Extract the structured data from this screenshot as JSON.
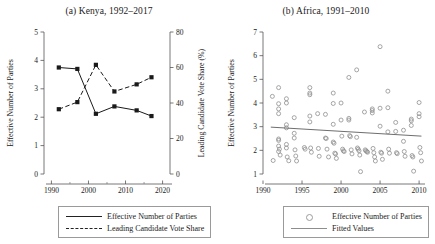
{
  "figure": {
    "panels": [
      {
        "id": "kenya",
        "title": "(a) Kenya, 1992–2017",
        "legend": [
          {
            "key": "solid-line",
            "label": "Effective Number of Parties"
          },
          {
            "key": "dashed-line",
            "label": "Leading Candidate Vote Share"
          }
        ]
      },
      {
        "id": "africa",
        "title": "(b) Africa, 1991–2010",
        "legend": [
          {
            "key": "open-circle",
            "label": "Effective Number of Parties"
          },
          {
            "key": "solid-line",
            "label": "Fitted Values"
          }
        ]
      }
    ]
  },
  "chart_data": [
    {
      "type": "line",
      "id": "kenya",
      "title": "(a) Kenya, 1992–2017",
      "xlabel": "",
      "ylabel": "Effective Number of Parties",
      "y2label": "Leading Candidate Vote Share (%)",
      "x": [
        1992,
        1997,
        2002,
        2007,
        2013,
        2017
      ],
      "xlim": [
        1988,
        2022
      ],
      "ylim": [
        0,
        5
      ],
      "y2lim": [
        0,
        80
      ],
      "xticks": [
        1990,
        2000,
        2010,
        2020
      ],
      "xticklabels": [
        "1990",
        "2000",
        "2010",
        "2020"
      ],
      "xminorticks": [
        1995,
        2005,
        2015
      ],
      "yticks": [
        0,
        1,
        2,
        3,
        4,
        5
      ],
      "yticklabels": [
        "0",
        "1",
        "2",
        "3",
        "4",
        "5"
      ],
      "y2ticks": [
        0,
        20,
        40,
        60,
        80
      ],
      "y2ticklabels": [
        "0",
        "20",
        "40",
        "60",
        "80"
      ],
      "grid": false,
      "legend_position": "below",
      "series": [
        {
          "name": "Effective Number of Parties",
          "style": "solid",
          "marker": "filled-square",
          "axis": "left",
          "values": [
            3.75,
            3.7,
            2.12,
            2.38,
            2.24,
            2.04
          ]
        },
        {
          "name": "Leading Candidate Vote Share",
          "style": "dashed",
          "marker": "filled-square",
          "axis": "right",
          "values": [
            36.5,
            40.5,
            61.5,
            46.5,
            50.5,
            54.5
          ]
        }
      ]
    },
    {
      "type": "scatter",
      "id": "africa",
      "title": "(b) Africa, 1991–2010",
      "xlabel": "",
      "ylabel": "Effective Number of Parties",
      "xlim": [
        1990,
        2010.5
      ],
      "ylim": [
        1,
        7
      ],
      "xticks": [
        1990,
        1995,
        2000,
        2005,
        2010
      ],
      "xticklabels": [
        "1990",
        "1995",
        "2000",
        "2005",
        "2010"
      ],
      "yticks": [
        1,
        2,
        3,
        4,
        5,
        6,
        7
      ],
      "yticklabels": [
        "1",
        "2",
        "3",
        "4",
        "5",
        "6",
        "7"
      ],
      "grid": false,
      "legend_position": "below",
      "marker": "open-circle",
      "points": [
        [
          1991.2,
          4.28
        ],
        [
          1991.3,
          1.57
        ],
        [
          1992.0,
          4.65
        ],
        [
          1992.0,
          3.97
        ],
        [
          1992.0,
          3.75
        ],
        [
          1992.0,
          3.55
        ],
        [
          1992.0,
          2.48
        ],
        [
          1992.0,
          2.42
        ],
        [
          1992.0,
          2.18
        ],
        [
          1992.0,
          1.95
        ],
        [
          1992.1,
          2.05
        ],
        [
          1992.2,
          1.8
        ],
        [
          1993.0,
          4.18
        ],
        [
          1993.0,
          4.0
        ],
        [
          1993.0,
          3.08
        ],
        [
          1993.0,
          2.95
        ],
        [
          1993.0,
          2.25
        ],
        [
          1993.0,
          2.1
        ],
        [
          1993.1,
          1.72
        ],
        [
          1993.3,
          1.56
        ],
        [
          1994.0,
          3.38
        ],
        [
          1994.0,
          2.72
        ],
        [
          1994.0,
          2.52
        ],
        [
          1994.1,
          2.02
        ],
        [
          1994.2,
          1.76
        ],
        [
          1994.3,
          1.55
        ],
        [
          1995.3,
          2.12
        ],
        [
          1995.4,
          2.05
        ],
        [
          1996.0,
          4.65
        ],
        [
          1996.0,
          4.42
        ],
        [
          1996.0,
          4.35
        ],
        [
          1996.0,
          3.45
        ],
        [
          1996.0,
          3.2
        ],
        [
          1996.1,
          2.1
        ],
        [
          1996.2,
          1.92
        ],
        [
          1997.0,
          3.55
        ],
        [
          1997.1,
          2.08
        ],
        [
          1997.2,
          1.75
        ],
        [
          1998.0,
          3.52
        ],
        [
          1998.0,
          2.52
        ],
        [
          1998.1,
          2.5
        ],
        [
          1998.2,
          2.05
        ],
        [
          1998.4,
          1.72
        ],
        [
          1999.0,
          4.42
        ],
        [
          1999.0,
          3.98
        ],
        [
          1999.0,
          3.1
        ],
        [
          1999.0,
          2.35
        ],
        [
          1999.1,
          2.3
        ],
        [
          1999.2,
          1.88
        ],
        [
          1999.3,
          1.85
        ],
        [
          1999.4,
          1.66
        ],
        [
          2000.0,
          4.0
        ],
        [
          2000.0,
          3.28
        ],
        [
          2000.1,
          2.6
        ],
        [
          2000.2,
          2.05
        ],
        [
          2000.3,
          1.98
        ],
        [
          2000.4,
          1.95
        ],
        [
          2001.0,
          5.08
        ],
        [
          2001.0,
          3.35
        ],
        [
          2001.0,
          3.28
        ],
        [
          2001.1,
          2.62
        ],
        [
          2001.2,
          2.58
        ],
        [
          2001.3,
          2.02
        ],
        [
          2001.4,
          1.85
        ],
        [
          2002.0,
          5.4
        ],
        [
          2002.0,
          2.55
        ],
        [
          2002.1,
          2.1
        ],
        [
          2002.2,
          2.05
        ],
        [
          2002.3,
          1.98
        ],
        [
          2002.4,
          1.8
        ],
        [
          2002.5,
          1.1
        ],
        [
          2003.0,
          3.62
        ],
        [
          2003.1,
          2.02
        ],
        [
          2003.2,
          1.98
        ],
        [
          2003.3,
          1.95
        ],
        [
          2003.4,
          1.92
        ],
        [
          2004.0,
          3.75
        ],
        [
          2004.0,
          3.68
        ],
        [
          2004.0,
          3.58
        ],
        [
          2004.1,
          2.08
        ],
        [
          2004.2,
          1.9
        ],
        [
          2004.3,
          1.72
        ],
        [
          2004.4,
          1.55
        ],
        [
          2005.0,
          6.38
        ],
        [
          2005.0,
          3.78
        ],
        [
          2005.0,
          3.02
        ],
        [
          2005.1,
          1.92
        ],
        [
          2005.2,
          1.88
        ],
        [
          2005.3,
          1.62
        ],
        [
          2006.0,
          4.5
        ],
        [
          2006.0,
          3.8
        ],
        [
          2006.0,
          2.78
        ],
        [
          2006.1,
          2.05
        ],
        [
          2006.2,
          1.88
        ],
        [
          2007.0,
          3.18
        ],
        [
          2007.0,
          2.8
        ],
        [
          2007.1,
          1.9
        ],
        [
          2007.2,
          1.86
        ],
        [
          2008.0,
          2.85
        ],
        [
          2008.0,
          2.38
        ],
        [
          2008.1,
          1.95
        ],
        [
          2008.2,
          1.75
        ],
        [
          2009.0,
          3.32
        ],
        [
          2009.0,
          3.25
        ],
        [
          2009.0,
          3.05
        ],
        [
          2009.1,
          1.78
        ],
        [
          2009.2,
          1.72
        ],
        [
          2009.3,
          1.12
        ],
        [
          2010.0,
          4.02
        ],
        [
          2010.0,
          3.55
        ],
        [
          2010.0,
          3.42
        ],
        [
          2010.1,
          2.12
        ],
        [
          2010.2,
          1.9
        ],
        [
          2010.3,
          1.55
        ]
      ],
      "fit_line": {
        "name": "Fitted Values",
        "x": [
          1991.0,
          2010.3
        ],
        "y": [
          2.98,
          2.6
        ]
      }
    }
  ]
}
